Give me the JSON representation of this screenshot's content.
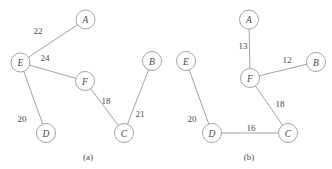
{
  "figure": {
    "background": "#ffffff",
    "stroke_color": "#8d8d8d",
    "text_color": "#4a4a4a",
    "node_radius": 9.5
  },
  "panels": [
    {
      "id": "panel-a",
      "caption": "(a)",
      "caption_x": 88,
      "caption_y": 157,
      "nodes": [
        {
          "label": "A",
          "x": 85.5,
          "y": 19.5
        },
        {
          "label": "E",
          "x": 20.5,
          "y": 62.5
        },
        {
          "label": "F",
          "x": 85.0,
          "y": 81.0
        },
        {
          "label": "B",
          "x": 152.0,
          "y": 61.0
        },
        {
          "label": "C",
          "x": 124.0,
          "y": 133.0
        },
        {
          "label": "D",
          "x": 46.0,
          "y": 133.0
        }
      ],
      "edges": [
        {
          "from": "E",
          "to": "A",
          "weight": "22",
          "label_x": 38,
          "label_y": 31
        },
        {
          "from": "E",
          "to": "F",
          "weight": "24",
          "label_x": 45,
          "label_y": 58
        },
        {
          "from": "E",
          "to": "D",
          "weight": "20",
          "label_x": 22,
          "label_y": 119
        },
        {
          "from": "F",
          "to": "C",
          "weight": "18",
          "label_x": 106,
          "label_y": 101
        },
        {
          "from": "B",
          "to": "C",
          "weight": "21",
          "label_x": 140,
          "label_y": 114
        }
      ]
    },
    {
      "id": "panel-b",
      "caption": "(b)",
      "caption_x": 249,
      "caption_y": 157,
      "nodes": [
        {
          "label": "A",
          "x": 249.0,
          "y": 19.5
        },
        {
          "label": "E",
          "x": 186.0,
          "y": 61.0
        },
        {
          "label": "F",
          "x": 250.0,
          "y": 78.0
        },
        {
          "label": "B",
          "x": 316.0,
          "y": 62.0
        },
        {
          "label": "C",
          "x": 288.0,
          "y": 133.0
        },
        {
          "label": "D",
          "x": 212.0,
          "y": 133.0
        }
      ],
      "edges": [
        {
          "from": "A",
          "to": "F",
          "weight": "13",
          "label_x": 243,
          "label_y": 46
        },
        {
          "from": "F",
          "to": "B",
          "weight": "12",
          "label_x": 287,
          "label_y": 60
        },
        {
          "from": "F",
          "to": "C",
          "weight": "18",
          "label_x": 280,
          "label_y": 104
        },
        {
          "from": "E",
          "to": "D",
          "weight": "20",
          "label_x": 192,
          "label_y": 119
        },
        {
          "from": "D",
          "to": "C",
          "weight": "16",
          "label_x": 251,
          "label_y": 128
        }
      ]
    }
  ]
}
